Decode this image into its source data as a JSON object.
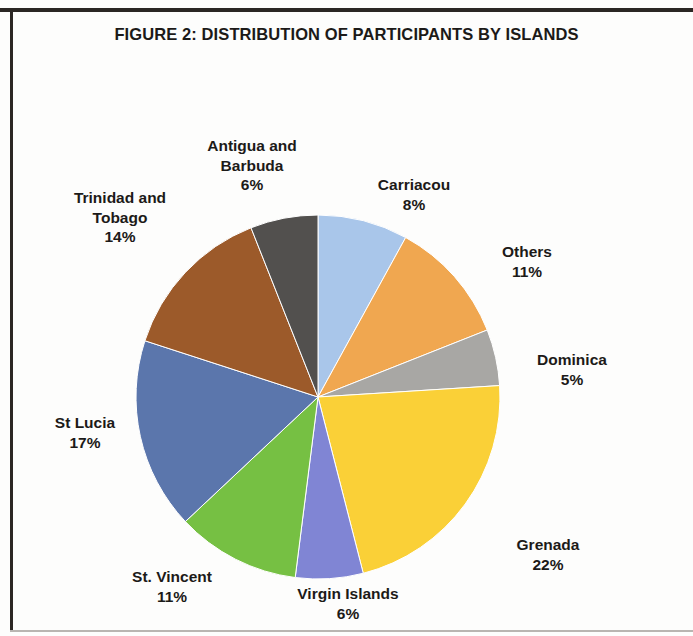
{
  "figure": {
    "title": "FIGURE 2: DISTRIBUTION OF PARTICIPANTS BY ISLANDS"
  },
  "chart_data": {
    "type": "pie",
    "title": "FIGURE 2: DISTRIBUTION OF PARTICIPANTS BY ISLANDS",
    "xlabel": "",
    "ylabel": "",
    "legend_position": "none",
    "labels_outside": true,
    "value_unit": "percent",
    "start_angle_deg": 0,
    "direction": "clockwise",
    "categories": [
      "Carriacou",
      "Others",
      "Dominica",
      "Grenada",
      "Virgin Islands",
      "St. Vincent",
      "St Lucia",
      "Trinidad and Tobago",
      "Antigua and Barbuda"
    ],
    "values": [
      8,
      11,
      5,
      22,
      6,
      11,
      17,
      14,
      6
    ],
    "colors": [
      "#a9c6ea",
      "#f0a750",
      "#a8a7a4",
      "#fad037",
      "#8085d4",
      "#76c043",
      "#5b76ac",
      "#9c5a2a",
      "#52504e"
    ],
    "slices": [
      {
        "name": "Carriacou",
        "value": 8,
        "label": "Carriacou",
        "pct_text": "8%",
        "color": "#a9c6ea"
      },
      {
        "name": "Others",
        "value": 11,
        "label": "Others",
        "pct_text": "11%",
        "color": "#f0a750"
      },
      {
        "name": "Dominica",
        "value": 5,
        "label": "Dominica",
        "pct_text": "5%",
        "color": "#a8a7a4"
      },
      {
        "name": "Grenada",
        "value": 22,
        "label": "Grenada",
        "pct_text": "22%",
        "color": "#fad037"
      },
      {
        "name": "Virgin Islands",
        "value": 6,
        "label": "Virgin Islands",
        "pct_text": "6%",
        "color": "#8085d4"
      },
      {
        "name": "St. Vincent",
        "value": 11,
        "label": "St. Vincent",
        "pct_text": "11%",
        "color": "#76c043"
      },
      {
        "name": "St Lucia",
        "value": 17,
        "label": "St Lucia",
        "pct_text": "17%",
        "color": "#5b76ac"
      },
      {
        "name": "Trinidad and Tobago",
        "value": 14,
        "label": "Trinidad and Tobago",
        "pct_text": "14%",
        "color": "#9c5a2a"
      },
      {
        "name": "Antigua and Barbuda",
        "value": 6,
        "label": "Antigua and Barbuda",
        "pct_text": "6%",
        "color": "#52504e"
      }
    ]
  },
  "labels": {
    "antigua": {
      "name": "Antigua and\nBarbuda",
      "pct": "6%"
    },
    "carriacou": {
      "name": "Carriacou",
      "pct": "8%"
    },
    "others": {
      "name": "Others",
      "pct": "11%"
    },
    "dominica": {
      "name": "Dominica",
      "pct": "5%"
    },
    "grenada": {
      "name": "Grenada",
      "pct": "22%"
    },
    "virgin": {
      "name": "Virgin Islands",
      "pct": "6%"
    },
    "stvincent": {
      "name": "St. Vincent",
      "pct": "11%"
    },
    "stlucia": {
      "name": "St Lucia",
      "pct": "17%"
    },
    "trinidad": {
      "name": "Trinidad and\nTobago",
      "pct": "14%"
    }
  }
}
